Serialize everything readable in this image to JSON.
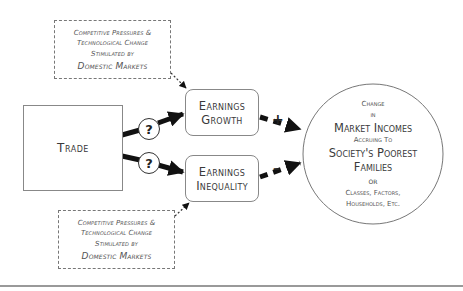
{
  "diagram": {
    "top_influence": {
      "lines": [
        "Competitive Pressures &",
        "Technological Change",
        "Stimulated by",
        "Domestic Markets"
      ]
    },
    "bottom_influence": {
      "lines": [
        "Competitive Pressures &",
        "Technological Change",
        "Stimulated by",
        "Domestic Markets"
      ]
    },
    "trade": {
      "label": "Trade"
    },
    "earnings_growth": {
      "line1": "Earnings",
      "line2": "Growth"
    },
    "earnings_inequality": {
      "line1": "Earnings",
      "line2": "Inequality"
    },
    "unknown_links": {
      "top": "?",
      "bottom": "?"
    },
    "effects": {
      "growth_sign": "+",
      "inequality_sign": "–"
    },
    "outcome": {
      "lines": [
        {
          "text": "Change",
          "size": "small"
        },
        {
          "text": "in",
          "size": "small"
        },
        {
          "text": "Market Incomes",
          "size": "large"
        },
        {
          "text": "Accruing To",
          "size": "small"
        },
        {
          "text": "Society's Poorest",
          "size": "large"
        },
        {
          "text": "Families",
          "size": "large"
        },
        {
          "text": "or",
          "size": "large"
        },
        {
          "text": "Classes, Factors,",
          "size": "small"
        },
        {
          "text": "Households, Etc.",
          "size": "small"
        }
      ]
    },
    "colors": {
      "arrow": "#111111",
      "border": "#888888",
      "text": "#3a3a3a",
      "dashed_text": "#555555"
    }
  }
}
